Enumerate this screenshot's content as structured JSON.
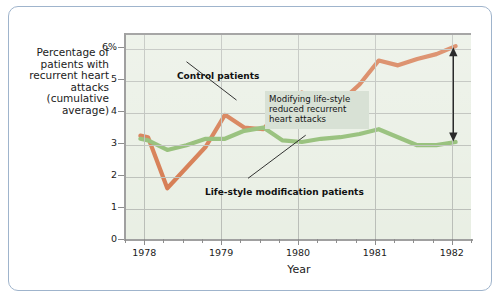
{
  "figure": {
    "border_color": "#9fb4cc",
    "background": "#ffffff"
  },
  "chart_data": {
    "type": "line",
    "title": "",
    "xlabel": "Year",
    "ylabel": "Percentage of patients with recurrent heart attacks (cumulative average)",
    "xlim": [
      1977.75,
      1982.25
    ],
    "ylim": [
      0,
      6.45
    ],
    "grid": true,
    "legend_position": "inline-annotations",
    "plot_background": "#e9efe4",
    "y_ticks": [
      0,
      1,
      2,
      3,
      4,
      5,
      6
    ],
    "y_tick_labels": [
      "0",
      "1",
      "2",
      "3",
      "4",
      "5",
      "6%"
    ],
    "x_ticks": [
      1978,
      1979,
      1980,
      1981,
      1982
    ],
    "x_tick_labels": [
      "1978",
      "1979",
      "1980",
      "1981",
      "1982"
    ],
    "x_minor_tick_interval": 0.25,
    "series": [
      {
        "name": "Control patients",
        "color": "#d4764a",
        "x": [
          1977.95,
          1978.05,
          1978.3,
          1978.55,
          1978.8,
          1979.05,
          1979.3,
          1979.55,
          1979.8,
          1980.05,
          1980.3,
          1980.55,
          1980.8,
          1981.05,
          1981.3,
          1981.55,
          1981.8,
          1982.05
        ],
        "values": [
          3.3,
          3.25,
          1.65,
          2.3,
          2.95,
          3.95,
          3.55,
          3.5,
          4.25,
          4.65,
          4.25,
          4.35,
          4.9,
          5.65,
          5.5,
          5.7,
          5.85,
          6.1
        ]
      },
      {
        "name": "Life-style modification patients",
        "color": "#8cba6e",
        "x": [
          1977.95,
          1978.05,
          1978.3,
          1978.55,
          1978.8,
          1979.05,
          1979.3,
          1979.55,
          1979.8,
          1980.05,
          1980.3,
          1980.55,
          1980.8,
          1981.05,
          1981.3,
          1981.55,
          1981.8,
          1982.05
        ],
        "values": [
          3.2,
          3.15,
          2.85,
          3.0,
          3.2,
          3.2,
          3.45,
          3.55,
          3.15,
          3.1,
          3.2,
          3.25,
          3.35,
          3.5,
          3.25,
          3.0,
          3.0,
          3.1
        ]
      }
    ],
    "annotations": [
      {
        "name": "control-patients-label",
        "text": "Control patients",
        "leader_from": [
          1978.55,
          5.55
        ],
        "leader_to": [
          1979.2,
          4.35
        ]
      },
      {
        "name": "lifestyle-label",
        "text": "Life-style modification patients",
        "leader_from": [
          1979.35,
          1.9
        ],
        "leader_to": [
          1980.1,
          3.25
        ]
      },
      {
        "name": "reduction-note",
        "text": "Modifying life-style reduced recurrent heart attacks",
        "background": "#d8e1d5"
      }
    ],
    "arrow": {
      "name": "difference-arrow",
      "x": 1982.02,
      "y_top": 6.0,
      "y_bottom": 3.05,
      "double_headed": true,
      "color": "#2a2a2a"
    }
  }
}
